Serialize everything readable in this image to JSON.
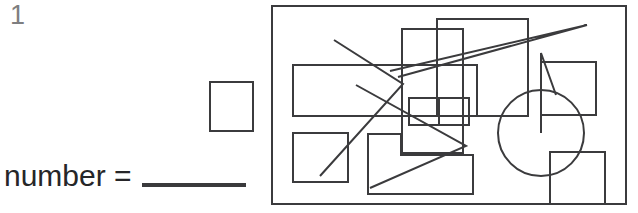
{
  "worksheet": {
    "question_number": "1",
    "answer_prompt_label": "number = ",
    "answer_blank": "",
    "answer_box_value": ""
  },
  "colors": {
    "ink": "#3b3b3d",
    "text": "#262628",
    "number_grey": "#7e7e80",
    "background": "#ffffff"
  },
  "figure": {
    "panel": {
      "x": 271,
      "y": 5,
      "width": 356,
      "height": 200
    },
    "stroke_width": 2,
    "shapes": [
      {
        "name": "rect-left-upper",
        "type": "rect",
        "points": "20,58 204,58 204,109 20,109"
      },
      {
        "name": "rect-left-lower",
        "type": "rect",
        "points": "20,126 75,126 75,175 20,175"
      },
      {
        "name": "rect-top-middle-left",
        "type": "rect",
        "points": "129,22 190,22 190,146 129,146"
      },
      {
        "name": "rect-top-middle-right",
        "type": "rect",
        "points": "164,12 255,12 255,109 164,109"
      },
      {
        "name": "rect-small-center-left",
        "type": "rect",
        "points": "136,91 166,91 166,118 136,118"
      },
      {
        "name": "rect-small-center-right",
        "type": "rect",
        "points": "166,91 196,91 196,118 166,118"
      },
      {
        "name": "rect-right-upper",
        "type": "rect",
        "points": "268,55 323,55 323,108 268,108"
      },
      {
        "name": "rect-right-lower",
        "type": "rect",
        "points": "277,145 332,145 332,197 277,197"
      },
      {
        "name": "polygon-stepped-bottom",
        "type": "polygon",
        "points": "95,127 128,127 128,148 200,148 200,187 95,187"
      },
      {
        "name": "circle-with-wedge",
        "type": "circle-wedge",
        "cx": 268,
        "cy": 126,
        "r": 43,
        "wedge": "268,126 268,46 283,88"
      },
      {
        "name": "arrow-long-upper-right",
        "type": "polyline",
        "points": "117,64 314,18 125,70"
      },
      {
        "name": "arrow-left-zigzag",
        "type": "polyline",
        "points": "61,33 130,77 47,169"
      },
      {
        "name": "arrow-lower-middle",
        "type": "polyline",
        "points": "83,78 193,139 97,181"
      }
    ]
  }
}
